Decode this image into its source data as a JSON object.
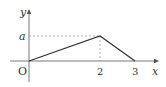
{
  "diagram": {
    "type": "piecewise-linear-graph",
    "axes": {
      "x_label": "x",
      "y_label": "y",
      "origin_label": "O"
    },
    "ticks": {
      "x": [
        "2",
        "3"
      ],
      "y": [
        "a"
      ]
    },
    "points": [
      {
        "x": 0,
        "y": 0,
        "label": "O"
      },
      {
        "x": 2,
        "y": "a"
      },
      {
        "x": 3,
        "y": 0
      }
    ],
    "guides": [
      {
        "type": "dashed",
        "from": "(0,a)",
        "to": "(2,a)"
      },
      {
        "type": "dashed",
        "from": "(2,0)",
        "to": "(2,a)"
      }
    ],
    "colors": {
      "line": "#333333",
      "axis": "#555555",
      "dashed": "#888888"
    }
  }
}
